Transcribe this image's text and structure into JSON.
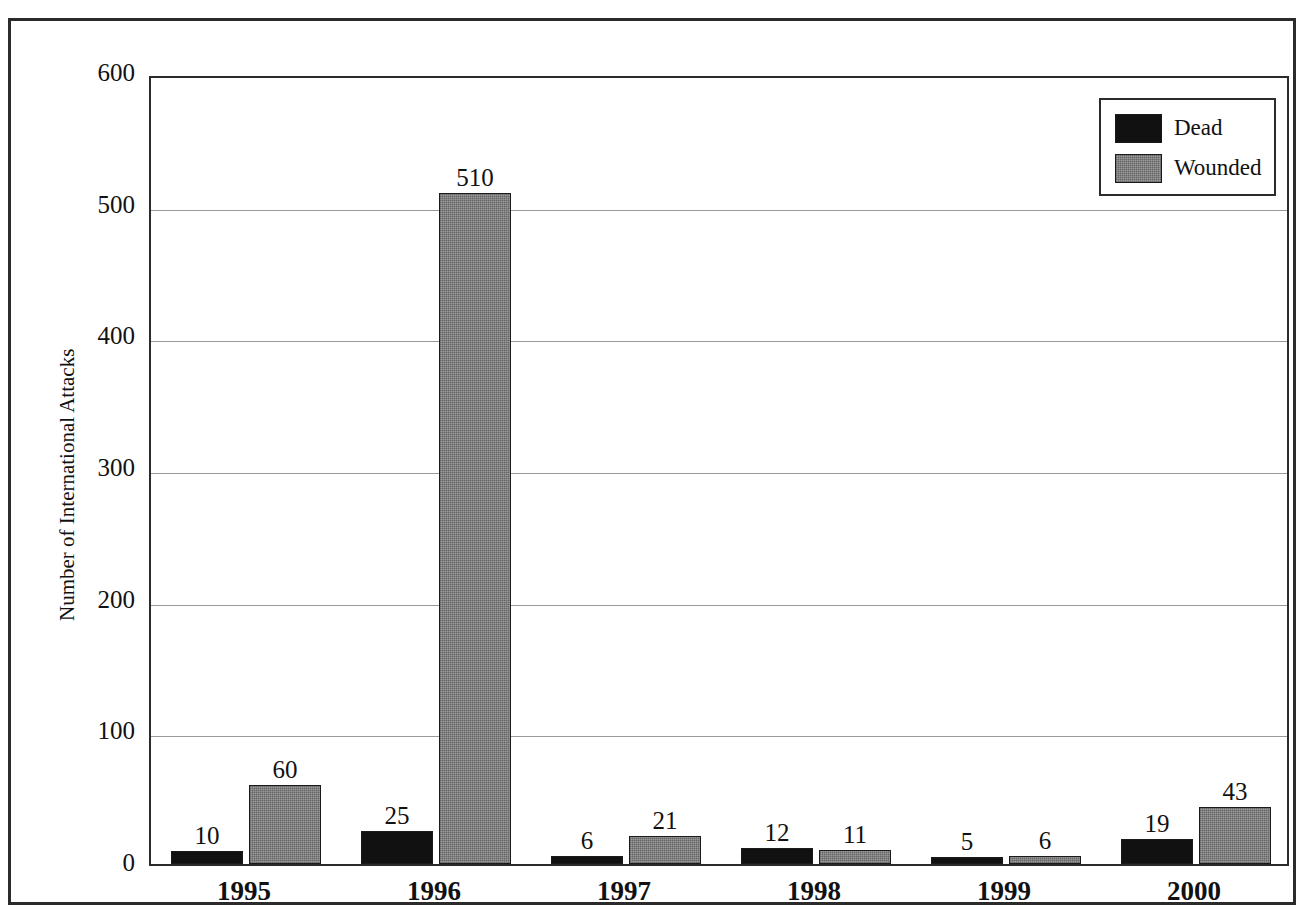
{
  "chart_data": {
    "type": "bar",
    "title": "",
    "xlabel": "",
    "ylabel": "Number of International Attacks",
    "categories": [
      "1995",
      "1996",
      "1997",
      "1998",
      "1999",
      "2000"
    ],
    "series": [
      {
        "name": "Dead",
        "color": "#111111",
        "values": [
          10,
          25,
          6,
          12,
          5,
          19
        ]
      },
      {
        "name": "Wounded",
        "color": "#808080",
        "values": [
          60,
          510,
          21,
          11,
          6,
          43
        ]
      }
    ],
    "ylim": [
      0,
      600
    ],
    "yticks": [
      0,
      100,
      200,
      300,
      400,
      500,
      600
    ],
    "ytick_labels": [
      "0",
      "100",
      "200",
      "300",
      "400",
      "500",
      "600"
    ],
    "grid": true,
    "legend_position": "top-right",
    "value_labels": [
      [
        "10",
        "60"
      ],
      [
        "25",
        "510"
      ],
      [
        "6",
        "21"
      ],
      [
        "12",
        "11"
      ],
      [
        "5",
        "6"
      ],
      [
        "19",
        "43"
      ]
    ]
  },
  "legend": {
    "items": [
      {
        "label": "Dead",
        "swatch": "black-swatch"
      },
      {
        "label": "Wounded",
        "swatch": "gray-swatch"
      }
    ]
  }
}
